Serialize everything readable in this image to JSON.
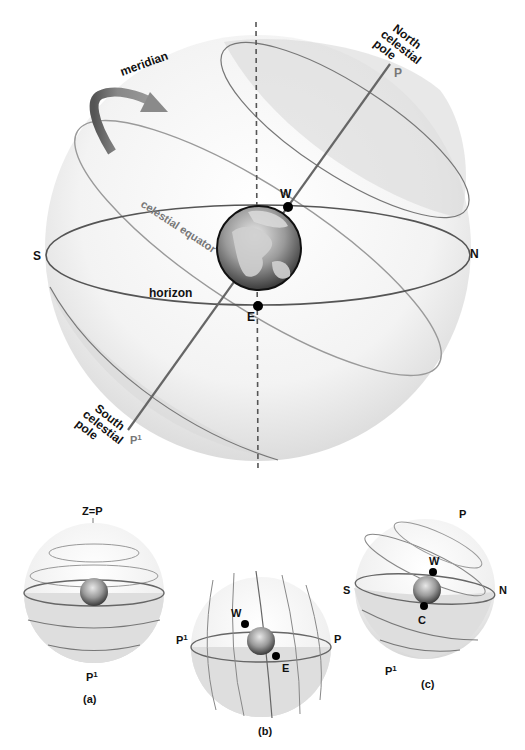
{
  "main_diagram": {
    "labels": {
      "meridian": "meridian",
      "north_pole_line1": "North",
      "north_pole_line2": "celestial",
      "north_pole_line3": "pole",
      "P": "P",
      "W": "W",
      "S": "S",
      "N": "N",
      "celestial_equator": "celestial equator",
      "horizon": "horizon",
      "E": "E",
      "south_pole_line1": "South",
      "south_pole_line2": "celestial",
      "south_pole_line3": "pole",
      "P1": "P",
      "P1_sup": "1"
    }
  },
  "sub_diagrams": [
    {
      "id": "a",
      "caption": "(a)",
      "top_label": "Z=P",
      "bottom_label": "P",
      "bottom_sup": "1"
    },
    {
      "id": "b",
      "caption": "(b)",
      "left_label": "P",
      "left_sup": "1",
      "right_label": "P",
      "W": "W",
      "E": "E"
    },
    {
      "id": "c",
      "caption": "(c)",
      "top_label": "P",
      "left_label": "S",
      "right_label": "N",
      "W": "W",
      "C": "C",
      "bottom_label": "P",
      "bottom_sup": "1"
    }
  ],
  "colors": {
    "sphere": "#ececec",
    "horizon_line": "#555555",
    "equator_line": "#9a9a9a",
    "axis_line": "#666666",
    "arrow": "#888888",
    "dot": "#000000"
  }
}
